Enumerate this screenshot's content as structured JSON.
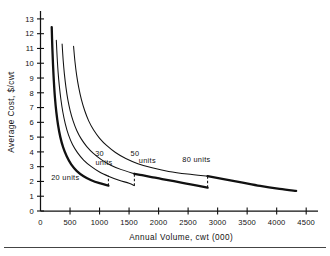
{
  "chart_data": {
    "type": "line",
    "title": "",
    "xlabel": "Annual Volume, cwt (000)",
    "ylabel": "Average Cost, $/cwt",
    "xlim": [
      0,
      4700
    ],
    "ylim": [
      0,
      13.4
    ],
    "grid": false,
    "legend_position": "inline-annotations",
    "xticks": [
      0,
      500,
      1000,
      1500,
      2000,
      2500,
      3000,
      3500,
      4000,
      4500
    ],
    "xtick_labels": [
      "0",
      "500",
      "1000",
      "1500",
      "2000",
      "2500",
      "3000",
      "3500",
      "4000",
      "4500"
    ],
    "yticks": [
      0,
      1,
      2,
      3,
      4,
      5,
      6,
      7,
      8,
      9,
      10,
      11,
      12,
      13
    ],
    "ytick_labels": [
      "0",
      "1",
      "2",
      "3",
      "4",
      "5",
      "6",
      "7",
      "8",
      "9",
      "10",
      "11",
      "12",
      "13"
    ],
    "series": [
      {
        "name": "20 units",
        "style": "bold",
        "points": [
          [
            190,
            12.45
          ],
          [
            200,
            11.1
          ],
          [
            212,
            9.9
          ],
          [
            226,
            8.8
          ],
          [
            244,
            7.7
          ],
          [
            268,
            6.7
          ],
          [
            298,
            5.8
          ],
          [
            336,
            5.0
          ],
          [
            384,
            4.3
          ],
          [
            444,
            3.7
          ],
          [
            520,
            3.15
          ],
          [
            616,
            2.7
          ],
          [
            730,
            2.35
          ],
          [
            860,
            2.08
          ],
          [
            1000,
            1.88
          ],
          [
            1150,
            1.72
          ]
        ],
        "end_x": 1150,
        "end_y": 1.72
      },
      {
        "name": "30 units",
        "style": "thin",
        "points": [
          [
            268,
            11.55
          ],
          [
            282,
            10.4
          ],
          [
            298,
            9.4
          ],
          [
            318,
            8.5
          ],
          [
            344,
            7.6
          ],
          [
            378,
            6.7
          ],
          [
            420,
            5.9
          ],
          [
            474,
            5.15
          ],
          [
            542,
            4.5
          ],
          [
            626,
            3.95
          ],
          [
            730,
            3.45
          ],
          [
            856,
            3.02
          ],
          [
            1000,
            2.64
          ],
          [
            1160,
            2.34
          ],
          [
            1330,
            2.08
          ],
          [
            1500,
            1.88
          ],
          [
            1590,
            1.72
          ]
        ],
        "end_x": 1590,
        "end_y": 1.72
      },
      {
        "name": "50 units",
        "style": "bold",
        "points": [
          [
            1590,
            2.52
          ],
          [
            1720,
            2.42
          ],
          [
            1880,
            2.3
          ],
          [
            2060,
            2.16
          ],
          [
            2260,
            2.02
          ],
          [
            2470,
            1.86
          ],
          [
            2680,
            1.7
          ],
          [
            2830,
            1.58
          ]
        ],
        "end_x": 2830,
        "end_y": 1.58
      },
      {
        "name": "50 units upper",
        "style": "thin",
        "points": [
          [
            366,
            11.3
          ],
          [
            384,
            10.2
          ],
          [
            404,
            9.3
          ],
          [
            430,
            8.4
          ],
          [
            462,
            7.55
          ],
          [
            502,
            6.8
          ],
          [
            552,
            6.1
          ],
          [
            614,
            5.45
          ],
          [
            690,
            4.88
          ],
          [
            784,
            4.36
          ],
          [
            896,
            3.9
          ],
          [
            1030,
            3.48
          ],
          [
            1190,
            3.1
          ],
          [
            1370,
            2.8
          ],
          [
            1590,
            2.52
          ]
        ]
      },
      {
        "name": "80 units",
        "style": "thin",
        "points": [
          [
            560,
            11.15
          ],
          [
            584,
            10.1
          ],
          [
            612,
            9.2
          ],
          [
            648,
            8.35
          ],
          [
            692,
            7.55
          ],
          [
            748,
            6.8
          ],
          [
            816,
            6.1
          ],
          [
            900,
            5.48
          ],
          [
            1002,
            4.92
          ],
          [
            1124,
            4.42
          ],
          [
            1270,
            3.96
          ],
          [
            1444,
            3.55
          ],
          [
            1650,
            3.2
          ],
          [
            1890,
            2.92
          ],
          [
            2170,
            2.68
          ],
          [
            2490,
            2.5
          ],
          [
            2830,
            2.36
          ]
        ],
        "end_x": 2830,
        "end_y": 2.36
      },
      {
        "name": "80 units tail",
        "style": "bold",
        "points": [
          [
            2830,
            2.36
          ],
          [
            3100,
            2.16
          ],
          [
            3400,
            1.94
          ],
          [
            3720,
            1.7
          ],
          [
            4050,
            1.5
          ],
          [
            4330,
            1.36
          ]
        ],
        "end_x": 4330,
        "end_y": 1.36
      }
    ],
    "jumps": [
      {
        "x": 1150,
        "y_low": 1.72,
        "y_high": 2.38,
        "label": "30 units"
      },
      {
        "x": 1590,
        "y_low": 1.72,
        "y_high": 2.52,
        "label": "50 units"
      },
      {
        "x": 2830,
        "y_low": 1.58,
        "y_high": 2.36,
        "label": "80 units"
      }
    ],
    "annotations": [
      {
        "text": "20 units",
        "x": 420,
        "y": 2.1,
        "name": "annotation-20-units"
      },
      {
        "text": "30",
        "x": 1000,
        "y": 3.7,
        "name": "annotation-30"
      },
      {
        "text": "units",
        "x": 1075,
        "y": 3.1,
        "name": "annotation-30-units"
      },
      {
        "text": "50",
        "x": 1600,
        "y": 3.7,
        "name": "annotation-50"
      },
      {
        "text": "units",
        "x": 1810,
        "y": 3.25,
        "name": "annotation-50-units"
      },
      {
        "text": "80 units",
        "x": 2640,
        "y": 3.3,
        "name": "annotation-80-units"
      }
    ]
  }
}
